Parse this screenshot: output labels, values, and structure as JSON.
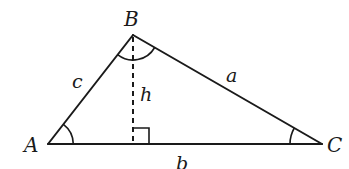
{
  "diagram": {
    "type": "triangle-with-altitude",
    "colors": {
      "stroke": "#1a1a1a",
      "background": "#ffffff"
    },
    "vertices": [
      {
        "label": "A",
        "x": 48,
        "y": 144
      },
      {
        "label": "B",
        "x": 133,
        "y": 35
      },
      {
        "label": "C",
        "x": 322,
        "y": 144
      }
    ],
    "sides": [
      {
        "label": "a",
        "from": "B",
        "to": "C"
      },
      {
        "label": "b",
        "from": "A",
        "to": "C"
      },
      {
        "label": "c",
        "from": "A",
        "to": "B"
      }
    ],
    "altitude": {
      "label": "h",
      "from": "B",
      "foot_x": 133,
      "foot_y": 144,
      "style": "dashed",
      "right_angle_marker": true
    },
    "angle_marks": [
      "A",
      "B",
      "C"
    ],
    "labels": {
      "vertex_a": "A",
      "vertex_b": "B",
      "vertex_c": "C",
      "side_a": "a",
      "side_b": "b",
      "side_c": "c",
      "height": "h"
    }
  }
}
